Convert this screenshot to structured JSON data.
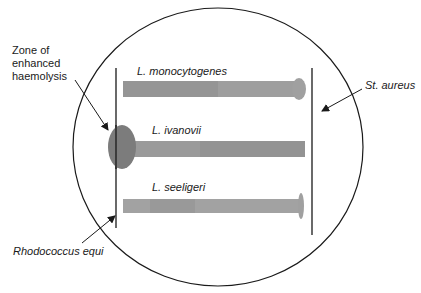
{
  "diagram": {
    "plate": {
      "shape": "circle",
      "cx": 218,
      "cy": 147,
      "rx": 145,
      "ry": 139,
      "stroke": "#1a1a1a"
    },
    "reference_streaks": [
      {
        "id": "rhodococcus-equi",
        "label": "Rhodococcus equi",
        "x": 116,
        "y1": 68,
        "y2": 228
      },
      {
        "id": "st-aureus",
        "label": "St. aureus",
        "x": 312,
        "y1": 68,
        "y2": 235
      }
    ],
    "test_streaks": [
      {
        "id": "l-monocytogenes",
        "label": "L. monocytogenes",
        "x1": 123,
        "x2": 302,
        "y": 81,
        "h": 16,
        "enhanced_zone_end": "right",
        "zone": {
          "cx": 299,
          "cy": 89,
          "rx": 6,
          "ry": 11
        }
      },
      {
        "id": "l-ivanovii",
        "label": "L. ivanovii",
        "x1": 130,
        "x2": 305,
        "y": 141,
        "h": 16,
        "enhanced_zone_end": "left",
        "zone": {
          "cx": 122,
          "cy": 147,
          "rx": 14,
          "ry": 22
        }
      },
      {
        "id": "l-seeligeri",
        "label": "L. seeligeri",
        "x1": 123,
        "x2": 300,
        "y": 199,
        "h": 14,
        "enhanced_zone_end": "right",
        "zone": {
          "cx": 300,
          "cy": 206,
          "rx": 3,
          "ry": 13
        }
      }
    ],
    "annotations": {
      "zone_label": [
        "Zone of",
        "enhanced",
        "haemolysis"
      ],
      "st_aureus": "St. aureus",
      "rhodococcus": "Rhodococcus equi",
      "l_monocytogenes": "L. monocytogenes",
      "l_ivanovii": "L. ivanovii",
      "l_seeligeri": "L. seeligeri"
    },
    "colors": {
      "streak": "#9a9a9a",
      "streak_dark": "#8a8a8a",
      "zone_ivanovii": "#7a7a7a",
      "zone_light": "#a3a3a3",
      "line": "#1a1a1a"
    }
  }
}
